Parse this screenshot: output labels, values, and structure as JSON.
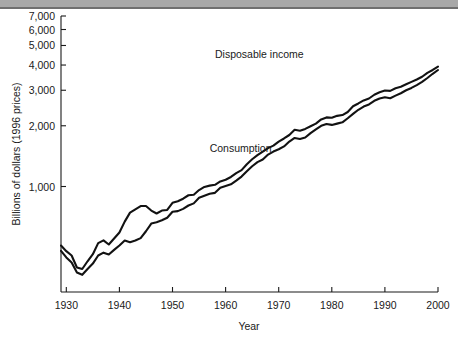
{
  "figure": {
    "background": "#ffffff",
    "top_rule_color": "#a8a8a8",
    "line_color": "#121212"
  },
  "chart_data": {
    "type": "line",
    "title": "",
    "subtitle": "",
    "xlabel": "Year",
    "ylabel": "Billions of dollars (1996 prices)",
    "xlim": [
      1929,
      2000
    ],
    "ylim": [
      300,
      7000
    ],
    "yscale": "log",
    "grid": false,
    "legend_position": "inline-annotation",
    "xticks": [
      1930,
      1940,
      1950,
      1960,
      1970,
      1980,
      1990,
      2000
    ],
    "xticklabels": [
      "1930",
      "1940",
      "1950",
      "1960",
      "1970",
      "1980",
      "1990",
      "2000"
    ],
    "yticks": [
      1000,
      2000,
      3000,
      4000,
      5000,
      6000,
      7000
    ],
    "yticklabels": [
      "1,000",
      "2,000",
      "3,000",
      "4,000",
      "5,000",
      "6,000",
      "7,000"
    ],
    "annotations": [
      {
        "text": "Disposable income",
        "x": 1958,
        "y": 4350
      },
      {
        "text": "Consumption",
        "x": 1957,
        "y": 1480
      }
    ],
    "x": [
      1929,
      1930,
      1931,
      1932,
      1933,
      1934,
      1935,
      1936,
      1937,
      1938,
      1939,
      1940,
      1941,
      1942,
      1943,
      1944,
      1945,
      1946,
      1947,
      1948,
      1949,
      1950,
      1951,
      1952,
      1953,
      1954,
      1955,
      1956,
      1957,
      1958,
      1959,
      1960,
      1961,
      1962,
      1963,
      1964,
      1965,
      1966,
      1967,
      1968,
      1969,
      1970,
      1971,
      1972,
      1973,
      1974,
      1975,
      1976,
      1977,
      1978,
      1979,
      1980,
      1981,
      1982,
      1983,
      1984,
      1985,
      1986,
      1987,
      1988,
      1989,
      1990,
      1991,
      1992,
      1993,
      1994,
      1995,
      1996,
      1997,
      1998,
      1999,
      2000
    ],
    "series": [
      {
        "name": "Disposable income",
        "values": [
          510,
          478,
          455,
          397,
          390,
          426,
          462,
          524,
          541,
          516,
          552,
          592,
          670,
          742,
          770,
          800,
          800,
          760,
          735,
          760,
          765,
          830,
          845,
          870,
          905,
          910,
          960,
          995,
          1010,
          1020,
          1060,
          1080,
          1115,
          1165,
          1205,
          1290,
          1365,
          1430,
          1490,
          1550,
          1595,
          1670,
          1730,
          1800,
          1910,
          1890,
          1930,
          1990,
          2050,
          2150,
          2200,
          2190,
          2240,
          2260,
          2340,
          2500,
          2580,
          2670,
          2730,
          2850,
          2930,
          2990,
          2980,
          3070,
          3120,
          3210,
          3300,
          3390,
          3500,
          3660,
          3780,
          3930
        ]
      },
      {
        "name": "Consumption",
        "values": [
          480,
          445,
          420,
          375,
          365,
          390,
          415,
          455,
          470,
          460,
          485,
          510,
          540,
          530,
          540,
          555,
          600,
          655,
          665,
          680,
          700,
          750,
          755,
          775,
          805,
          825,
          880,
          900,
          920,
          930,
          985,
          1005,
          1025,
          1070,
          1120,
          1190,
          1260,
          1320,
          1360,
          1440,
          1490,
          1530,
          1580,
          1670,
          1740,
          1720,
          1750,
          1840,
          1920,
          2000,
          2040,
          2020,
          2050,
          2080,
          2180,
          2290,
          2400,
          2490,
          2550,
          2660,
          2730,
          2770,
          2740,
          2820,
          2900,
          3000,
          3080,
          3180,
          3300,
          3450,
          3620,
          3780
        ]
      }
    ]
  },
  "geometry": {
    "plot_left": 61,
    "plot_right": 438,
    "plot_bottom": 292,
    "plot_top": 16,
    "tick_len": 5
  }
}
